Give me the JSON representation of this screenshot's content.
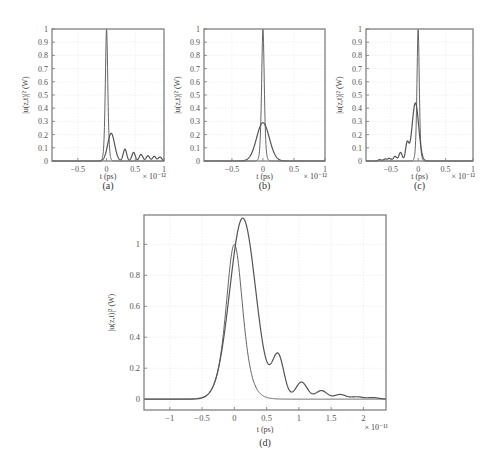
{
  "figure": {
    "captions": [
      "(a)",
      "(b)",
      "(c)",
      "(d)"
    ]
  },
  "chart_data": [
    {
      "id": "a",
      "type": "line",
      "caption": "(a)",
      "xlabel": "t (ps)",
      "ylabel": "|u(z,t)|² (W)",
      "x_multiplier": "× 10⁻¹²",
      "xlim": [
        -1,
        1
      ],
      "ylim": [
        0,
        1
      ],
      "xticks": [
        -0.5,
        0,
        0.5,
        1
      ],
      "xtick_labels": [
        "−0.5",
        "0",
        "0.5",
        "1"
      ],
      "yticks": [
        0,
        0.1,
        0.2,
        0.3,
        0.4,
        0.5,
        0.6,
        0.7,
        0.8,
        0.9,
        1
      ],
      "ytick_labels": [
        "0",
        "0.1",
        "0.2",
        "0.3",
        "0.4",
        "0.5",
        "0.6",
        "0.7",
        "0.8",
        "0.9",
        "1"
      ],
      "grid": true,
      "series": [
        {
          "name": "input pulse",
          "peak_x": 0,
          "peak_y": 1.0,
          "width": 0.05
        },
        {
          "name": "output pulse",
          "main_peak": [
            0.08,
            0.21
          ],
          "side_peaks_x": [
            0.32,
            0.47,
            0.6,
            0.72,
            0.83,
            0.93
          ],
          "side_peaks_y": [
            0.09,
            0.065,
            0.05,
            0.04,
            0.035,
            0.03
          ]
        }
      ]
    },
    {
      "id": "b",
      "type": "line",
      "caption": "(b)",
      "xlabel": "t (ps)",
      "ylabel": "|u(z,t)|² (W)",
      "x_multiplier": "× 10⁻¹²",
      "xlim": [
        -1,
        1
      ],
      "ylim": [
        0,
        1
      ],
      "xticks": [
        -0.5,
        0,
        0.5,
        1
      ],
      "xtick_labels": [
        "−0.5",
        "0",
        "0.5",
        "1"
      ],
      "yticks": [
        0,
        0.1,
        0.2,
        0.3,
        0.4,
        0.5,
        0.6,
        0.7,
        0.8,
        0.9,
        1
      ],
      "ytick_labels": [
        "0",
        "0.1",
        "0.2",
        "0.3",
        "0.4",
        "0.5",
        "0.6",
        "0.7",
        "0.8",
        "0.9",
        "1"
      ],
      "grid": true,
      "series": [
        {
          "name": "input pulse",
          "peak_x": 0,
          "peak_y": 1.0,
          "width": 0.05
        },
        {
          "name": "output pulse",
          "peak_x": 0,
          "peak_y": 0.29,
          "width": 0.17
        }
      ]
    },
    {
      "id": "c",
      "type": "line",
      "caption": "(c)",
      "xlabel": "t (ps)",
      "ylabel": "|u(z,t)|² (W)",
      "x_multiplier": "× 10⁻¹²",
      "xlim": [
        -1,
        1
      ],
      "ylim": [
        0,
        1
      ],
      "xticks": [
        -0.5,
        0,
        0.5,
        1
      ],
      "xtick_labels": [
        "−0.5",
        "0",
        "0.5",
        "1"
      ],
      "yticks": [
        0,
        0.1,
        0.2,
        0.3,
        0.4,
        0.5,
        0.6,
        0.7,
        0.8,
        0.9,
        1
      ],
      "ytick_labels": [
        "0",
        "0.1",
        "0.2",
        "0.3",
        "0.4",
        "0.5",
        "0.6",
        "0.7",
        "0.8",
        "0.9",
        "1"
      ],
      "grid": true,
      "series": [
        {
          "name": "input pulse",
          "peak_x": 0,
          "peak_y": 1.0,
          "width": 0.05
        },
        {
          "name": "output pulse",
          "main_peak": [
            -0.05,
            0.44
          ],
          "side_peaks_x": [
            -0.2,
            -0.32,
            -0.42,
            -0.52,
            -0.6,
            -0.7
          ],
          "side_peaks_y": [
            0.13,
            0.065,
            0.035,
            0.02,
            0.015,
            0.01
          ]
        }
      ]
    },
    {
      "id": "d",
      "type": "line",
      "caption": "(d)",
      "xlabel": "t (ps)",
      "ylabel": "|u(z,t)|² (W)",
      "x_multiplier": "× 10⁻¹¹",
      "xlim": [
        -1.4,
        2.35
      ],
      "ylim": [
        -0.07,
        1.19
      ],
      "xticks": [
        -1,
        -0.5,
        0,
        0.5,
        1,
        1.5,
        2
      ],
      "xtick_labels": [
        "−1",
        "−0.5",
        "0",
        "0.5",
        "1",
        "1.5",
        "2"
      ],
      "yticks": [
        0,
        0.2,
        0.4,
        0.6,
        0.8,
        1
      ],
      "ytick_labels": [
        "0",
        "0.2",
        "0.4",
        "0.6",
        "0.8",
        "1"
      ],
      "grid": true,
      "series": [
        {
          "name": "input pulse",
          "peak_x": 0,
          "peak_y": 1.0,
          "width": 0.3
        },
        {
          "name": "output pulse",
          "main_peak": [
            0.13,
            1.17
          ],
          "side_peaks_x": [
            0.68,
            1.04,
            1.35,
            1.64,
            1.9,
            2.15
          ],
          "side_peaks_y": [
            0.27,
            0.11,
            0.055,
            0.03,
            0.015,
            0.01
          ]
        }
      ]
    }
  ]
}
